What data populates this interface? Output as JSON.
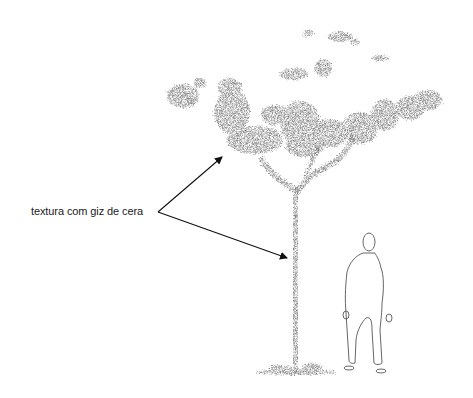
{
  "annotation": {
    "label": "textura com giz de cera"
  },
  "illustration": {
    "subject": "tree drawn with crayon texture beside a human figure outline",
    "colors": {
      "crayon": "#707070",
      "crayon_dark": "#5a5a5a",
      "line": "#222222",
      "figure": "#555555"
    }
  }
}
